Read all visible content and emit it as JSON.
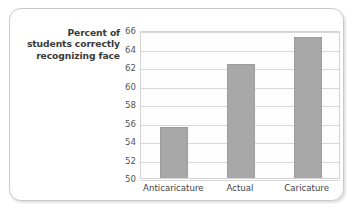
{
  "chart_data": {
    "type": "bar",
    "title": "",
    "xlabel": "",
    "ylabel": "Percent of students correctly recognizing face",
    "ylabel_lines": [
      "Percent of",
      "students correctly",
      "recognizing face"
    ],
    "categories": [
      "Anticaricature",
      "Actual",
      "Caricature"
    ],
    "values": [
      55.4,
      62.2,
      65.1
    ],
    "ylim": [
      50,
      66
    ],
    "ytick_step": 2,
    "yticks": [
      66,
      64,
      62,
      60,
      58,
      56,
      54,
      52,
      50
    ],
    "ytick_labels": [
      "66",
      "64",
      "62",
      "60",
      "58",
      "56",
      "54",
      "52",
      "50"
    ],
    "grid": true,
    "grid_axis": "y",
    "legend": false,
    "legend_position": "none",
    "bar_color": "#a8a8a8",
    "bar_edge_color": "#9d9d9d",
    "plot_background": "#fdfdfd",
    "plot_border_color": "#d3d3d3",
    "gridline_color": "#d8d8d8"
  },
  "frame": {
    "border_color": "#c9c9c9",
    "background": "#ffffff"
  }
}
